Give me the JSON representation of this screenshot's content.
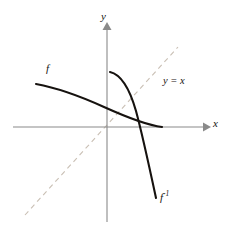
{
  "figure": {
    "background_color": "#ffffff",
    "width": 232,
    "height": 233
  },
  "axes": {
    "x_axis": {
      "label": "x",
      "color": "#8a8a8a",
      "start_px": [
        13,
        127
      ],
      "end_px": [
        208,
        127
      ],
      "arrow": "right"
    },
    "y_axis": {
      "label": "y",
      "color": "#8a8a8a",
      "start_px": [
        107,
        222
      ],
      "end_px": [
        107,
        25
      ],
      "arrow": "up"
    },
    "origin_px": [
      107,
      127
    ]
  },
  "identity_line": {
    "label": "y = x",
    "style": "dashed",
    "color": "#c9bfb4",
    "start_px": [
      25,
      215
    ],
    "end_px": [
      178,
      47
    ]
  },
  "curves": [
    {
      "name": "f",
      "label": "f",
      "color": "#16120f",
      "description": "decreasing concave-down curve entering from upper left, crossing the y-axis and ending at the x-axis on the right",
      "path": "M 36,84 C 62,90 88,100 110,110 C 132,120 148,126 162,127",
      "label_px": [
        46,
        63
      ]
    },
    {
      "name": "f-inverse",
      "label": "f",
      "superscript": "-1",
      "color": "#16120f",
      "description": "reflection of f about y = x: starts near the y-axis at top, bends right then plunges steeply down to lower right",
      "path": "M 110,72 C 122,75 131,92 137,113 C 143,134 150,170 156,198",
      "label_px": [
        160,
        190
      ]
    }
  ],
  "labels": {
    "y_axis": "y",
    "x_axis": "x",
    "f": "f",
    "identity": "y = x",
    "f_inverse_base": "f",
    "f_inverse_exponent": "-1"
  }
}
